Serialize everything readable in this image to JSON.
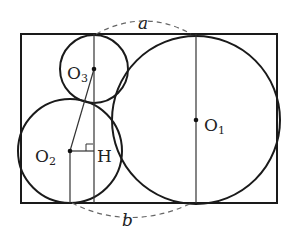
{
  "diagram": {
    "rectangle": {
      "x": 21,
      "y": 34,
      "width": 256,
      "height": 169
    },
    "circles": [
      {
        "name": "O1",
        "cx": 196,
        "cy": 120,
        "r": 84
      },
      {
        "name": "O2",
        "cx": 70,
        "cy": 151,
        "r": 52
      },
      {
        "name": "O3",
        "cx": 94,
        "cy": 69,
        "r": 34
      }
    ],
    "points": {
      "O1": {
        "x": 196,
        "y": 120
      },
      "O2": {
        "x": 70,
        "y": 151
      },
      "O3": {
        "x": 94,
        "y": 69
      },
      "H": {
        "x": 94,
        "y": 151
      }
    },
    "labels": {
      "O1": "O",
      "O1_sub": "1",
      "O2": "O",
      "O2_sub": "2",
      "O3": "O",
      "O3_sub": "3",
      "H": "H",
      "a": "a",
      "b": "b"
    },
    "colors": {
      "stroke": "#1a1a1a",
      "dashed": "#666666",
      "background": "#ffffff"
    }
  }
}
